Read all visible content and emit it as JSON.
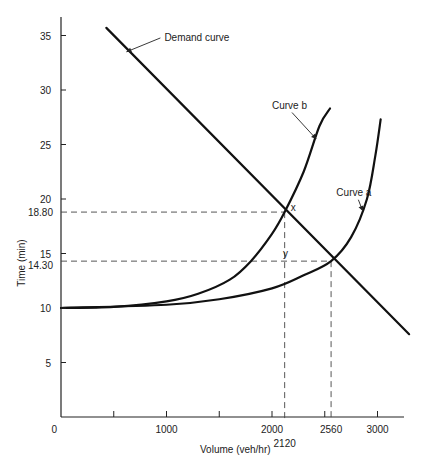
{
  "chart_data": {
    "type": "line",
    "title": "",
    "xlabel": "Volume (veh/hr)",
    "ylabel": "Time (min)",
    "xlim": [
      0,
      3350
    ],
    "ylim": [
      0,
      37
    ],
    "grid": false,
    "x_ticks": [
      {
        "value": 500,
        "label": ""
      },
      {
        "value": 1000,
        "label": "1000"
      },
      {
        "value": 1500,
        "label": ""
      },
      {
        "value": 2000,
        "label": "2000"
      },
      {
        "value": 2500,
        "label": ""
      },
      {
        "value": 3000,
        "label": "3000"
      }
    ],
    "x_origin_label": "0",
    "y_ticks": [
      {
        "value": 5,
        "label": "5"
      },
      {
        "value": 10,
        "label": "10"
      },
      {
        "value": 15,
        "label": "15"
      },
      {
        "value": 20,
        "label": "20"
      },
      {
        "value": 25,
        "label": "25"
      },
      {
        "value": 30,
        "label": "30"
      },
      {
        "value": 35,
        "label": "35"
      }
    ],
    "extra_y_labels": [
      {
        "value": 18.8,
        "label": "18.80"
      },
      {
        "value": 14.3,
        "label": "14.30"
      }
    ],
    "extra_x_labels": [
      {
        "value": 2120,
        "label": "2120"
      },
      {
        "value": 2560,
        "label": "2560"
      }
    ],
    "series": [
      {
        "name": "Demand curve",
        "x": [
          430,
          3300
        ],
        "y": [
          35.7,
          7.6
        ]
      },
      {
        "name": "Curve b",
        "x": [
          0,
          500,
          1000,
          1300,
          1600,
          1800,
          2000,
          2120,
          2300,
          2450,
          2550
        ],
        "y": [
          10,
          10.1,
          10.6,
          11.3,
          12.6,
          14.3,
          16.8,
          18.8,
          22.5,
          26.7,
          28.3
        ]
      },
      {
        "name": "Curve a",
        "x": [
          0,
          1000,
          1500,
          2000,
          2300,
          2560,
          2750,
          2900,
          2980,
          3030
        ],
        "y": [
          10,
          10.3,
          10.8,
          11.8,
          13.0,
          14.3,
          16.5,
          20.0,
          24.0,
          27.3
        ]
      }
    ],
    "reference_points": [
      {
        "name": "x",
        "label": "x",
        "volume": 2120,
        "time": 18.8
      },
      {
        "name": "y",
        "label": "y",
        "volume": 2560,
        "time": 14.3
      }
    ],
    "annotations": [
      {
        "text": "Demand curve",
        "target": "Demand curve",
        "anchor_x": 620,
        "anchor_y": 33.5,
        "text_x": 980,
        "text_y": 34.5
      },
      {
        "text": "Curve b",
        "target": "Curve b",
        "anchor_x": 2420,
        "anchor_y": 25.5,
        "text_x": 2000,
        "text_y": 28.3
      },
      {
        "text": "Curve a",
        "target": "Curve a",
        "anchor_x": 2860,
        "anchor_y": 18.9,
        "text_x": 2610,
        "text_y": 20.3
      }
    ]
  }
}
